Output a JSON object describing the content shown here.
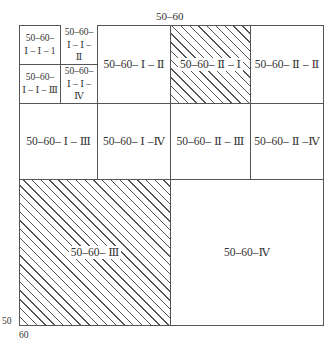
{
  "diagram": {
    "top_label": "50–60",
    "axis": {
      "y_label": "50",
      "x_label": "60"
    },
    "colors": {
      "line": "#555555",
      "hatch": "#555555",
      "background": "#ffffff"
    },
    "cells": {
      "i_i_1": {
        "line1": "50–60–",
        "line2": "Ⅰ – Ⅰ – 1",
        "hatched": false
      },
      "i_i_2": {
        "line1": "50–60–",
        "line2": "Ⅰ – Ⅰ – Ⅱ",
        "hatched": true,
        "hatch": "partial-forward"
      },
      "i_i_3": {
        "line1": "50–60–",
        "line2": "Ⅰ – Ⅰ – Ⅲ",
        "hatched": false
      },
      "i_i_4": {
        "line1": "50–60–",
        "line2": "Ⅰ – Ⅰ –Ⅳ",
        "hatched": false
      },
      "i_ii": {
        "label": "50–60– Ⅰ – Ⅱ",
        "hatched": false
      },
      "ii_i": {
        "label": "50–60– Ⅱ – Ⅰ",
        "hatched": true,
        "hatch": "diagonal"
      },
      "ii_ii": {
        "label": "50–60– Ⅱ – Ⅱ",
        "hatched": false
      },
      "i_iii": {
        "label": "50–60– Ⅰ – Ⅲ",
        "hatched": false
      },
      "i_iv": {
        "label": "50–60– Ⅰ –Ⅳ",
        "hatched": false
      },
      "ii_iii": {
        "label": "50–60– Ⅱ – Ⅲ",
        "hatched": false
      },
      "ii_iv": {
        "label": "50–60– Ⅱ –Ⅳ",
        "hatched": false
      },
      "iii": {
        "label": "50–60– Ⅲ",
        "hatched": true,
        "hatch": "diagonal"
      },
      "iv": {
        "label": "50–60–Ⅳ",
        "hatched": false
      }
    }
  }
}
